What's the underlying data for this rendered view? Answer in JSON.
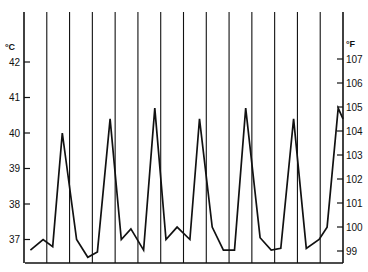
{
  "chart_data": {
    "type": "line",
    "title": "",
    "xlabel": "",
    "ylabel": "°C",
    "ylabel_right": "°F",
    "grid": {
      "vertical": true,
      "horizontal": false
    },
    "vertical_grid_count": 15,
    "ylim": [
      36.35,
      43.0
    ],
    "left_axis": {
      "unit": "°C",
      "ticks": [
        42,
        41,
        40,
        39,
        38,
        37
      ]
    },
    "right_axis": {
      "unit": "°F",
      "ticks": [
        107,
        106,
        105,
        104,
        103,
        102,
        101,
        100,
        99
      ]
    },
    "series": [
      {
        "name": "temperature",
        "color": "#111111",
        "x": [
          0.02,
          0.06,
          0.09,
          0.12,
          0.165,
          0.2,
          0.23,
          0.27,
          0.305,
          0.335,
          0.375,
          0.41,
          0.445,
          0.48,
          0.52,
          0.55,
          0.59,
          0.625,
          0.66,
          0.695,
          0.74,
          0.775,
          0.805,
          0.845,
          0.885,
          0.925,
          0.95,
          0.985,
          1.0
        ],
        "values": [
          36.7,
          37.0,
          36.8,
          40.0,
          37.0,
          36.5,
          36.65,
          40.4,
          37.0,
          37.3,
          36.7,
          40.7,
          37.0,
          37.35,
          37.0,
          40.4,
          37.35,
          36.7,
          36.7,
          40.7,
          37.05,
          36.7,
          36.75,
          40.4,
          36.75,
          37.0,
          37.35,
          40.7,
          40.4
        ]
      }
    ]
  },
  "axes": {
    "left_unit": "°C",
    "right_unit": "°F",
    "left_ticks": [
      {
        "label": "42",
        "value": 42
      },
      {
        "label": "41",
        "value": 41
      },
      {
        "label": "40",
        "value": 40
      },
      {
        "label": "39",
        "value": 39
      },
      {
        "label": "38",
        "value": 38
      },
      {
        "label": "37",
        "value": 37
      }
    ],
    "right_ticks": [
      {
        "label": "107",
        "value": 107
      },
      {
        "label": "106",
        "value": 106
      },
      {
        "label": "105",
        "value": 105
      },
      {
        "label": "104",
        "value": 104
      },
      {
        "label": "103",
        "value": 103
      },
      {
        "label": "102",
        "value": 102
      },
      {
        "label": "101",
        "value": 101
      },
      {
        "label": "100",
        "value": 100
      },
      {
        "label": "99",
        "value": 99
      }
    ]
  }
}
